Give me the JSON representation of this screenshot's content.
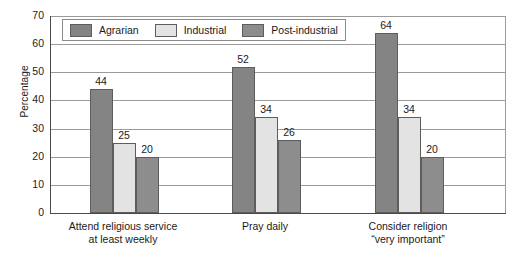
{
  "chart_data": {
    "type": "bar",
    "title": "",
    "xlabel": "",
    "ylabel": "Percentage",
    "ylim": [
      0,
      70
    ],
    "ytick_step": 10,
    "yticks": [
      70,
      60,
      50,
      40,
      30,
      20,
      10,
      0
    ],
    "grid": true,
    "legend_position": "top-left-inside",
    "categories": [
      "Attend religious service at least weekly",
      "Pray daily",
      "Consider religion “very important”"
    ],
    "category_lines": [
      [
        "Attend religious service",
        "at least weekly"
      ],
      [
        "Pray daily",
        ""
      ],
      [
        "Consider religion",
        "“very important”"
      ]
    ],
    "series": [
      {
        "name": "Agrarian",
        "color": "#848484",
        "values": [
          44,
          52,
          64
        ]
      },
      {
        "name": "Industrial",
        "color": "#e3e3e3",
        "values": [
          25,
          34,
          34
        ]
      },
      {
        "name": "Post-industrial",
        "color": "#8d8d8d",
        "values": [
          20,
          26,
          20
        ]
      }
    ],
    "value_labels": [
      [
        "44",
        "25",
        "20"
      ],
      [
        "52",
        "34",
        "26"
      ],
      [
        "64",
        "34",
        "20"
      ]
    ]
  },
  "axis": {
    "y_title": "Percentage",
    "y_ticks": [
      "70",
      "60",
      "50",
      "40",
      "30",
      "20",
      "10",
      "0"
    ]
  },
  "legend": {
    "items": [
      {
        "label": "Agrarian"
      },
      {
        "label": "Industrial"
      },
      {
        "label": "Post-industrial"
      }
    ]
  },
  "colors": {
    "series1": "#848484",
    "series2": "#e3e3e3",
    "series3": "#8d8d8d",
    "bar_border": "#5d5d5d",
    "gridline": "#9a9a9a",
    "axis": "#4a4a4a",
    "background": "#ffffff"
  }
}
